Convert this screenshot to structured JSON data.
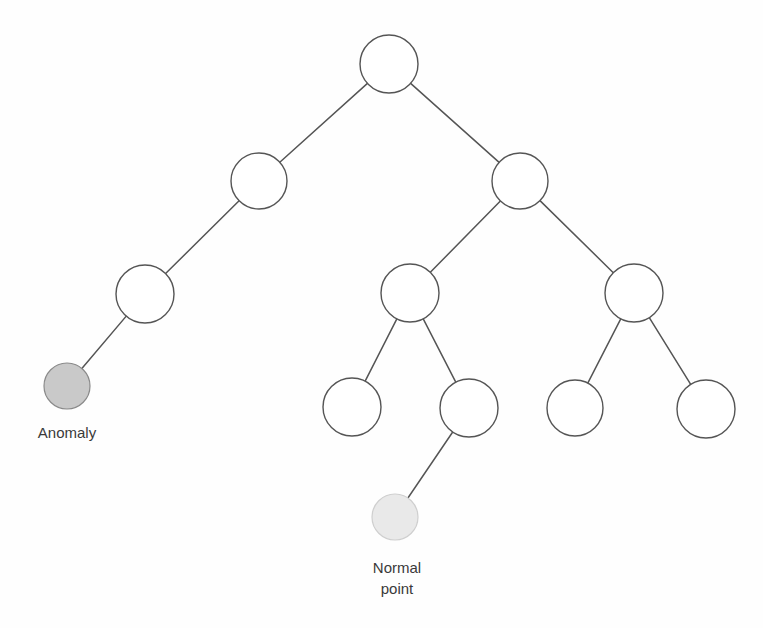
{
  "diagram": {
    "type": "isolation-tree",
    "title": "",
    "background_color": "#fefefe",
    "stroke_color": "#555555",
    "node_fill_empty": "#ffffff",
    "node_fill_anomaly": "#c9c9c9",
    "node_fill_normal": "#e9e9e9",
    "nodes": [
      {
        "id": "root",
        "label": "",
        "cx": 389,
        "cy": 64,
        "r": 29,
        "style": "empty"
      },
      {
        "id": "n-l",
        "label": "",
        "cx": 259,
        "cy": 181,
        "r": 28,
        "style": "empty"
      },
      {
        "id": "n-r",
        "label": "",
        "cx": 520,
        "cy": 181,
        "r": 28,
        "style": "empty"
      },
      {
        "id": "n-ll",
        "label": "",
        "cx": 145,
        "cy": 294,
        "r": 29,
        "style": "empty"
      },
      {
        "id": "n-rl",
        "label": "",
        "cx": 410,
        "cy": 293,
        "r": 29,
        "style": "empty"
      },
      {
        "id": "n-rr",
        "label": "",
        "cx": 634,
        "cy": 293,
        "r": 29,
        "style": "empty"
      },
      {
        "id": "n-anom",
        "label": "Anomaly",
        "cx": 67,
        "cy": 386,
        "r": 23,
        "style": "anomaly"
      },
      {
        "id": "n-rll",
        "label": "",
        "cx": 352,
        "cy": 407,
        "r": 29,
        "style": "empty"
      },
      {
        "id": "n-rlr",
        "label": "",
        "cx": 469,
        "cy": 408,
        "r": 29,
        "style": "empty"
      },
      {
        "id": "n-rrl",
        "label": "",
        "cx": 575,
        "cy": 408,
        "r": 28,
        "style": "empty"
      },
      {
        "id": "n-rrr",
        "label": "",
        "cx": 706,
        "cy": 409,
        "r": 29,
        "style": "empty"
      },
      {
        "id": "n-normal",
        "label": "Normal point",
        "cx": 395,
        "cy": 517,
        "r": 23,
        "style": "normal"
      }
    ],
    "edges": [
      {
        "from": "root",
        "to": "n-l"
      },
      {
        "from": "root",
        "to": "n-r"
      },
      {
        "from": "n-l",
        "to": "n-ll"
      },
      {
        "from": "n-r",
        "to": "n-rl"
      },
      {
        "from": "n-r",
        "to": "n-rr"
      },
      {
        "from": "n-ll",
        "to": "n-anom"
      },
      {
        "from": "n-rl",
        "to": "n-rll"
      },
      {
        "from": "n-rl",
        "to": "n-rlr"
      },
      {
        "from": "n-rr",
        "to": "n-rrl"
      },
      {
        "from": "n-rr",
        "to": "n-rrr"
      },
      {
        "from": "n-rlr",
        "to": "n-normal"
      }
    ],
    "labels": [
      {
        "id": "label-anomaly",
        "text": "Anomaly",
        "x": 67,
        "y": 438,
        "lines": [
          "Anomaly"
        ]
      },
      {
        "id": "label-normal",
        "text": "Normal point",
        "x": 397,
        "y": 573,
        "lines": [
          "Normal",
          "point"
        ]
      }
    ]
  }
}
